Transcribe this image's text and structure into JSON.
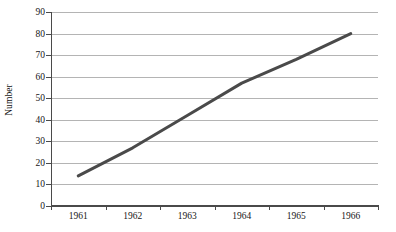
{
  "chart_data": {
    "type": "line",
    "title": "",
    "xlabel": "",
    "ylabel": "Number",
    "xlim": [
      1960.5,
      1966.5
    ],
    "ylim": [
      0,
      90
    ],
    "grid": true,
    "legend": false,
    "legend_position": "none",
    "y_ticks": [
      0,
      10,
      20,
      30,
      40,
      50,
      60,
      70,
      80,
      90
    ],
    "y_tick_labels": [
      "0",
      "10",
      "20",
      "30",
      "40",
      "50",
      "60",
      "70",
      "80",
      "90"
    ],
    "categories": [
      "1961",
      "1962",
      "1963",
      "1964",
      "1965",
      "1966"
    ],
    "x": [
      1961,
      1962,
      1963,
      1964,
      1965,
      1966
    ],
    "series": [
      {
        "name": "Number",
        "color": "#4a4a4a",
        "line_width": 3,
        "marker": "none",
        "values": [
          14,
          27,
          42,
          57,
          68,
          80
        ]
      }
    ]
  },
  "axes": {
    "y_title": "Number",
    "y_tick_labels": [
      "90",
      "80",
      "70",
      "60",
      "50",
      "40",
      "30",
      "20",
      "10",
      "0"
    ],
    "x_tick_labels": [
      "1961",
      "1962",
      "1963",
      "1964",
      "1965",
      "1966"
    ]
  },
  "colors": {
    "line": "#4a4a4a",
    "gridline": "#b4b4b4",
    "axis": "#4a4a4a",
    "text": "#161616",
    "background": "#ffffff"
  }
}
